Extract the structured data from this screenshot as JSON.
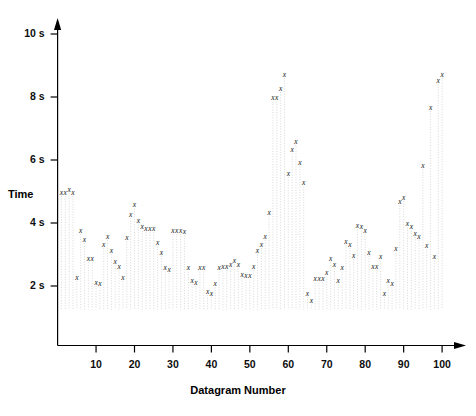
{
  "chart_data": {
    "type": "scatter",
    "title": "",
    "xlabel": "Datagram Number",
    "ylabel": "Time",
    "xlim": [
      0,
      104
    ],
    "ylim": [
      1.0,
      10.4
    ],
    "grid": false,
    "legend": null,
    "marker": "x",
    "y_tick_labels": [
      "2 s",
      "4 s",
      "6 s",
      "8 s",
      "10 s"
    ],
    "y_tick_values": [
      2,
      4,
      6,
      8,
      10
    ],
    "x_tick_labels": [
      "10",
      "20",
      "30",
      "40",
      "50",
      "60",
      "70",
      "80",
      "90",
      "100"
    ],
    "x_tick_values": [
      10,
      20,
      30,
      40,
      50,
      60,
      70,
      80,
      90,
      100
    ],
    "x": [
      1,
      2,
      3,
      4,
      5,
      6,
      7,
      8,
      9,
      10,
      11,
      12,
      13,
      14,
      15,
      16,
      17,
      18,
      19,
      20,
      21,
      22,
      23,
      24,
      25,
      26,
      27,
      28,
      29,
      30,
      31,
      32,
      33,
      34,
      35,
      36,
      37,
      38,
      39,
      40,
      41,
      42,
      43,
      44,
      45,
      46,
      47,
      48,
      49,
      50,
      51,
      52,
      53,
      54,
      55,
      56,
      57,
      58,
      59,
      60,
      61,
      62,
      63,
      64,
      65,
      66,
      67,
      68,
      69,
      70,
      71,
      72,
      73,
      74,
      75,
      76,
      77,
      78,
      79,
      80,
      81,
      82,
      83,
      84,
      85,
      86,
      87,
      88,
      89,
      90,
      91,
      92,
      93,
      94,
      95,
      96,
      97,
      98,
      99,
      100
    ],
    "y": [
      4.95,
      4.95,
      5.05,
      4.95,
      2.25,
      3.75,
      3.45,
      2.85,
      2.85,
      2.1,
      2.05,
      3.3,
      3.55,
      3.1,
      2.75,
      2.6,
      2.25,
      3.5,
      4.25,
      4.55,
      4.05,
      3.85,
      3.8,
      3.8,
      3.8,
      3.35,
      3.05,
      2.55,
      2.5,
      3.75,
      3.75,
      3.75,
      3.7,
      2.55,
      2.15,
      2.1,
      2.55,
      2.55,
      1.8,
      1.75,
      2.05,
      2.55,
      2.6,
      2.6,
      2.65,
      2.8,
      2.65,
      2.35,
      2.3,
      2.3,
      2.6,
      3.1,
      3.3,
      3.55,
      4.3,
      7.95,
      7.95,
      8.25,
      8.7,
      5.55,
      6.3,
      6.55,
      5.9,
      5.25,
      1.75,
      1.5,
      2.2,
      2.2,
      2.2,
      2.4,
      2.85,
      2.65,
      2.15,
      2.55,
      3.4,
      3.3,
      2.95,
      3.9,
      3.85,
      3.75,
      3.05,
      2.6,
      2.6,
      2.9,
      1.75,
      2.15,
      2.05,
      3.15,
      4.65,
      4.8,
      3.95,
      3.85,
      3.65,
      3.55,
      5.8,
      3.25,
      7.65,
      2.9,
      8.5,
      8.7
    ]
  },
  "axis": {
    "y_label": "Time",
    "x_label": "Datagram Number"
  }
}
